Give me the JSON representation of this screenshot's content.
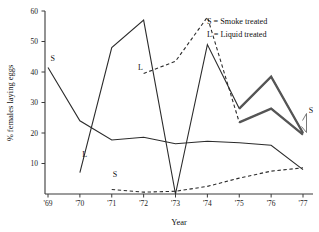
{
  "chart_data": {
    "type": "line",
    "title": "",
    "xlabel": "Year",
    "ylabel": "% females laying eggs",
    "xlim": [
      1968.6,
      1977.4
    ],
    "ylim": [
      0,
      60
    ],
    "grid": false,
    "legend_position": "top-right",
    "x": [
      "'69",
      "'70",
      "'71",
      "'72",
      "'73",
      "'74",
      "'75",
      "'76",
      "'77"
    ],
    "x_numeric": [
      1969,
      1970,
      1971,
      1972,
      1973,
      1974,
      1975,
      1976,
      1977
    ],
    "y_ticks": [
      10,
      20,
      30,
      40,
      50,
      60
    ],
    "series": [
      {
        "name": "S = Smoke treated (upper, solid)",
        "key": "smoke_upper",
        "style": "solid",
        "x": [
          1969,
          1970,
          1971,
          1972,
          1973,
          1974,
          1975,
          1976,
          1977
        ],
        "values": [
          41.5,
          24.0,
          17.7,
          18.6,
          16.5,
          17.3,
          16.8,
          16.0,
          8.0
        ]
      },
      {
        "name": "L = Liquid treated (rising, solid)",
        "key": "liquid_solid",
        "style": "solid",
        "x": [
          1970,
          1971,
          1972,
          1973,
          1974,
          1975,
          1976,
          1977
        ],
        "values": [
          7.0,
          48.0,
          57.0,
          0.0,
          49.0,
          28.0,
          38.5,
          20.0
        ]
      },
      {
        "name": "S = Smoke treated (lower, dashed)",
        "key": "smoke_dashed",
        "style": "dashed",
        "x": [
          1971,
          1972,
          1973,
          1974,
          1975,
          1976,
          1977
        ],
        "values": [
          1.5,
          0.6,
          0.9,
          2.5,
          5.2,
          7.5,
          8.6
        ]
      },
      {
        "name": "L = Liquid treated (dashed)",
        "key": "liquid_dashed",
        "style": "dashed",
        "x": [
          1972,
          1973,
          1974,
          1975,
          1976,
          1977
        ],
        "values": [
          39.5,
          43.5,
          58.0,
          23.5,
          28.0,
          19.5
        ]
      },
      {
        "name": "Overlay thick (upper, '75-'77)",
        "key": "overlay_upper",
        "style": "thick",
        "x": [
          1975,
          1976,
          1977
        ],
        "values": [
          28.0,
          38.5,
          20.0
        ]
      },
      {
        "name": "Overlay thick (lower, '75-'77)",
        "key": "overlay_lower",
        "style": "thick",
        "x": [
          1975,
          1976,
          1977
        ],
        "values": [
          23.5,
          28.0,
          19.5
        ]
      }
    ],
    "annotations": [
      {
        "label": "S",
        "x": 1969.15,
        "y": 43.5,
        "name": "series-tag-s-upper"
      },
      {
        "label": "L",
        "x": 1970.15,
        "y": 12.0,
        "name": "series-tag-l-left"
      },
      {
        "label": "L",
        "x": 1971.9,
        "y": 40.5,
        "name": "series-tag-l-mid"
      },
      {
        "label": "S",
        "x": 1971.1,
        "y": 5.5,
        "name": "series-tag-s-lower"
      },
      {
        "label": "S",
        "x": 1977.25,
        "y": 26.5,
        "name": "series-tag-s-right"
      }
    ],
    "legend": [
      {
        "symbol": "S",
        "text": "S = Smoke treated"
      },
      {
        "symbol": "L",
        "text": "L = Liquid treated"
      }
    ]
  },
  "colors": {
    "axis": "#3a3a3a",
    "line": "#2b2b2b",
    "overlay": "#555555",
    "background": "#ffffff"
  }
}
